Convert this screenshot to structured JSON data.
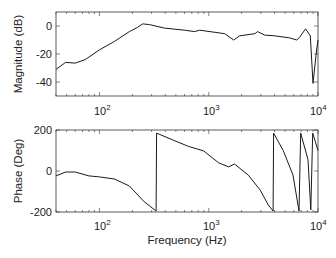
{
  "chart_data": [
    {
      "type": "line",
      "title": "",
      "xlabel": "",
      "ylabel": "Magnitude (dB)",
      "xscale": "log",
      "xlim": [
        40,
        10000
      ],
      "ylim": [
        -50,
        10
      ],
      "xticks": [
        100,
        1000,
        10000
      ],
      "xtick_labels": [
        "10^2",
        "10^3",
        "10^4"
      ],
      "yticks": [
        0,
        -20,
        -40
      ],
      "ytick_labels": [
        "0",
        "-20",
        "-40"
      ],
      "grid": false,
      "series": [
        {
          "name": "magnitude",
          "x": [
            40,
            49,
            60,
            74,
            100,
            137,
            188,
            223,
            248,
            287,
            394,
            602,
            742,
            824,
            1140,
            1400,
            1690,
            1920,
            2640,
            2800,
            3250,
            4000,
            5500,
            6400,
            6800,
            7700,
            8500,
            9000,
            9700,
            10000
          ],
          "values": [
            -31,
            -26,
            -26.5,
            -24,
            -17,
            -11,
            -4,
            -1,
            1.5,
            1,
            -1.5,
            -3,
            -4,
            -3,
            -4.5,
            -5.5,
            -10,
            -7,
            -5.5,
            -4,
            -6.5,
            -7,
            -8.5,
            -10,
            -8,
            -2,
            -7,
            -41,
            -17,
            -10
          ]
        }
      ]
    },
    {
      "type": "line",
      "title": "",
      "xlabel": "Frequency (Hz)",
      "ylabel": "Phase (Deg)",
      "xscale": "log",
      "xlim": [
        40,
        10000
      ],
      "ylim": [
        -200,
        200
      ],
      "xticks": [
        100,
        1000,
        10000
      ],
      "xtick_labels": [
        "10^2",
        "10^3",
        "10^4"
      ],
      "yticks": [
        200,
        0,
        -200
      ],
      "ytick_labels": [
        "200",
        "0",
        "-200"
      ],
      "grid": false,
      "series": [
        {
          "name": "phase",
          "x": [
            40,
            49,
            60,
            80,
            100,
            137,
            188,
            257,
            330,
            333,
            477,
            653,
            900,
            1230,
            1520,
            1720,
            2300,
            2960,
            3500,
            3880,
            3920,
            4800,
            5900,
            6700,
            6950,
            8100,
            8600,
            8950,
            10000
          ],
          "values": [
            -24,
            -5,
            -5,
            -24,
            -29,
            -39,
            -73,
            -150,
            -195,
            185,
            150,
            120,
            98,
            40,
            20,
            34,
            -20,
            -93,
            -165,
            -195,
            185,
            100,
            -20,
            -195,
            185,
            55,
            -190,
            185,
            100
          ]
        }
      ]
    }
  ],
  "labels": {
    "mag_ylabel": "Magnitude (dB)",
    "phase_ylabel": "Phase (Deg)",
    "xlabel": "Frequency (Hz)",
    "ten": "10",
    "exp2": "2",
    "exp3": "3",
    "exp4": "4",
    "mag_ticks": [
      "0",
      "-20",
      "-40"
    ],
    "phase_ticks": [
      "200",
      "0",
      "-200"
    ]
  },
  "colors": {
    "line": "#1a1a1a",
    "axis": "#333333",
    "text": "#222222"
  }
}
